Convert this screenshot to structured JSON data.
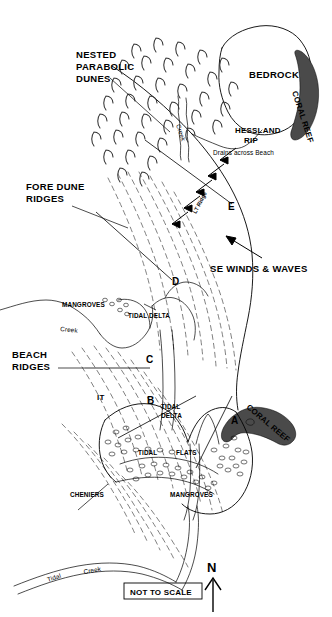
{
  "figure": {
    "title_labels": {
      "nested_parabolic_dunes": "NESTED\nPARABOLIC\nDUNES",
      "nested_parabolic_dunes_line1": "NESTED",
      "nested_parabolic_dunes_line2": "PARABOLIC",
      "nested_parabolic_dunes_line3": "DUNES",
      "fore_dune_ridges_line1": "FORE DUNE",
      "fore_dune_ridges_line2": "RIDGES",
      "beach_ridges_line1": "BEACH",
      "beach_ridges_line2": "RIDGES",
      "bedrock": "BEDROCK",
      "coral_reef_top": "CORAL REEF",
      "coral_reef_bottom": "CORAL REEF",
      "hessland_rip_line1": "HESSLAND",
      "hessland_rip_line2": "RIP",
      "drains_across_beach": "Drains across Beach",
      "se_winds_waves": "SE WINDS & WAVES",
      "lt_ridge": "LT Ridge",
      "mangroves_upper": "MANGROVES",
      "mangroves_lower": "MANGROVES",
      "tidal_delta_upper": "TIDAL DELTA",
      "tidal_delta_lower_line1": "TIDAL",
      "tidal_delta_lower_line2": "DELTA",
      "tidal_flats_word1": "TIDAL",
      "tidal_flats_word2": "FLATS",
      "cheniers": "CHENIERS",
      "creek_upper": "Creek",
      "tidal_creek_word1": "Tidal",
      "tidal_creek_word2": "Creek",
      "creek_bedrock": "Creek",
      "it_marker": "IT"
    },
    "transects": [
      {
        "id": "A",
        "label": "A"
      },
      {
        "id": "B",
        "label": "B"
      },
      {
        "id": "C",
        "label": "C"
      },
      {
        "id": "D",
        "label": "D"
      },
      {
        "id": "E",
        "label": "E"
      }
    ],
    "scale_note": "NOT TO SCALE",
    "north_label": "N",
    "colors": {
      "reef_fill": "#4a4a4a",
      "line": "#000000",
      "ridge_line": "#555555",
      "background": "#ffffff"
    }
  }
}
